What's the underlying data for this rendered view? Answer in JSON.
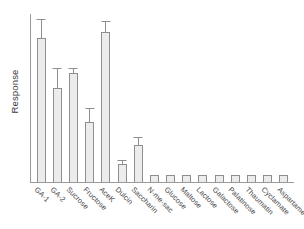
{
  "chart_data": {
    "type": "bar",
    "title": "",
    "subtitle": "",
    "xlabel": "",
    "ylabel": "Response",
    "grid": false,
    "legend": false,
    "legend_position": "none",
    "y_tick_labels": [],
    "x_tick_rotation": 45,
    "ylim": [
      0,
      100
    ],
    "y_axis_units": "arbitrary (relative response, no numeric ticks shown)",
    "bar_fill_color": "#ececec",
    "bar_edge_color": "#8e8e8e",
    "axis_color": "#9a9a9a",
    "categories": [
      "GA-1",
      "GA-2",
      "Sucrose",
      "Fructose",
      "AceK",
      "Dulcin",
      "Saccharin",
      "N-me-sac",
      "Glucose",
      "Maltose",
      "Lactose",
      "Galactose",
      "Palatinose",
      "Thaumatin",
      "Cyclamate",
      "Aspartame"
    ],
    "values": [
      86,
      56,
      65,
      36,
      89,
      11,
      22,
      4,
      4,
      4,
      4,
      4,
      4,
      4,
      4,
      4
    ],
    "errors": [
      11,
      12,
      3,
      8,
      7,
      2,
      5,
      0,
      0,
      0,
      0,
      0,
      0,
      0,
      0,
      0
    ],
    "has_error_bars": [
      true,
      true,
      true,
      true,
      true,
      true,
      true,
      false,
      false,
      false,
      false,
      false,
      false,
      false,
      false,
      false
    ]
  }
}
